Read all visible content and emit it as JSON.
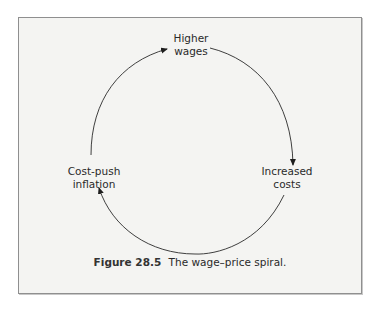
{
  "diagram": {
    "type": "cycle",
    "nodes": [
      {
        "id": "higher_wages",
        "line1": "Higher",
        "line2": "wages"
      },
      {
        "id": "increased_costs",
        "line1": "Increased",
        "line2": "costs"
      },
      {
        "id": "cost_push_inflation",
        "line1": "Cost-push",
        "line2": "inflation"
      }
    ],
    "edges": [
      {
        "from": "higher_wages",
        "to": "increased_costs"
      },
      {
        "from": "increased_costs",
        "to": "cost_push_inflation"
      },
      {
        "from": "cost_push_inflation",
        "to": "higher_wages"
      }
    ],
    "direction": "clockwise"
  },
  "caption": {
    "number": "Figure 28.5",
    "text": "The wage–price spiral."
  },
  "colors": {
    "frame_background": "#f4f4f2",
    "frame_border": "#8f8f8f",
    "stroke": "#2a2a2a"
  }
}
